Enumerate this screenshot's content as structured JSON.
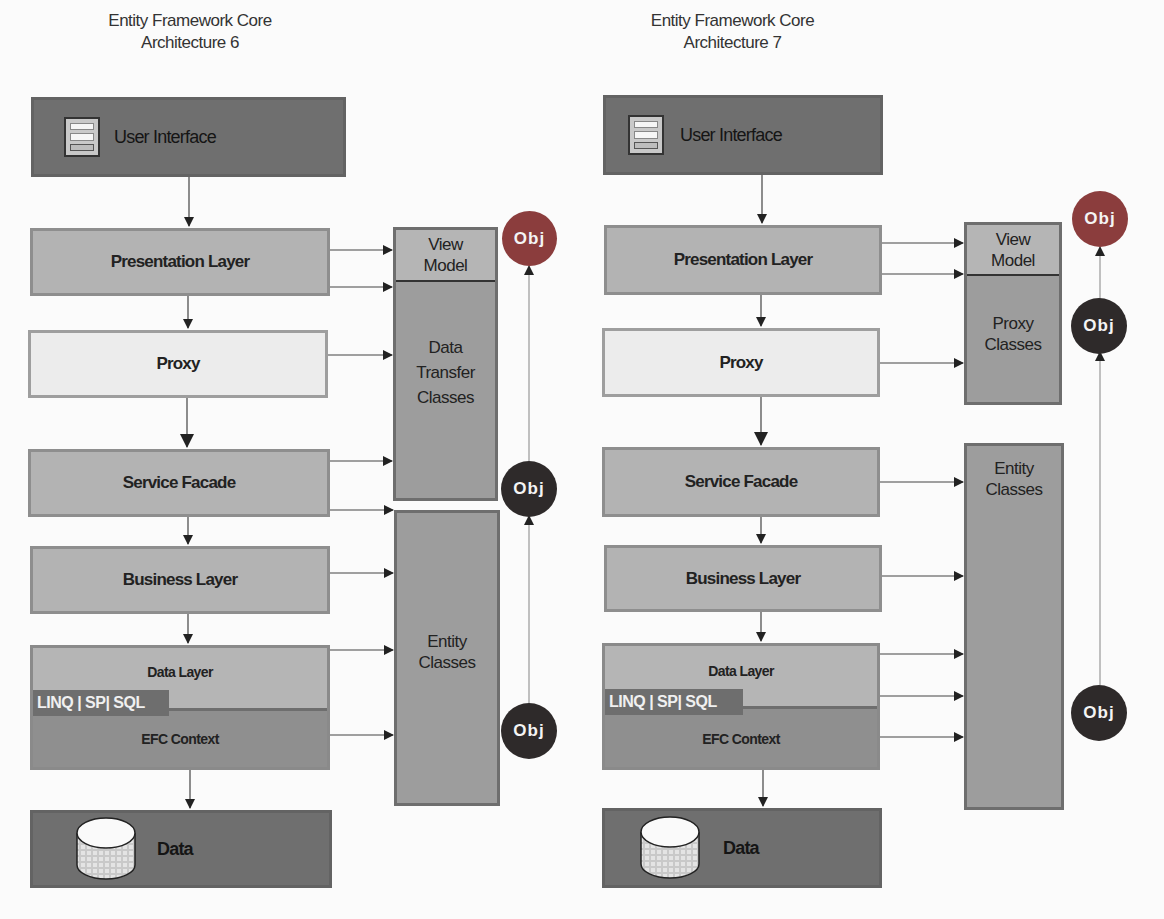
{
  "diagrams": [
    {
      "title_line1": "Entity Framework Core",
      "title_line2": "Architecture 6",
      "layers": {
        "user_interface": "User Interface",
        "presentation": "Presentation Layer",
        "proxy": "Proxy",
        "service_facade": "Service Facade",
        "business": "Business Layer",
        "data_layer": "Data Layer",
        "data_access_tag": "LINQ | SP| SQL",
        "efc_context": "EFC Context",
        "data": "Data"
      },
      "side_boxes": {
        "view_model": "View\nModel",
        "data_transfer": "Data\nTransfer\nClasses",
        "entity_classes": "Entity\nClasses"
      },
      "objects": [
        "Obj",
        "Obj",
        "Obj"
      ]
    },
    {
      "title_line1": "Entity Framework Core",
      "title_line2": "Architecture 7",
      "layers": {
        "user_interface": "User Interface",
        "presentation": "Presentation Layer",
        "proxy": "Proxy",
        "service_facade": "Service Facade",
        "business": "Business Layer",
        "data_layer": "Data Layer",
        "data_access_tag": "LINQ | SP| SQL",
        "efc_context": "EFC Context",
        "data": "Data"
      },
      "side_boxes": {
        "view_model": "View\nModel",
        "proxy_classes": "Proxy\nClasses",
        "entity_classes": "Entity\nClasses"
      },
      "objects": [
        "Obj",
        "Obj",
        "Obj"
      ]
    }
  ],
  "colors": {
    "dark_layer": "#6f6f6f",
    "mid_layer": "#b3b3b3",
    "light_layer": "#ececec",
    "obj_red": "#8b3d3d",
    "obj_dark": "#2e2a2a"
  }
}
